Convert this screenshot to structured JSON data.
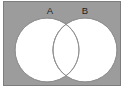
{
  "figure": {
    "kind": "venn-diagram",
    "canvas_width": 139,
    "canvas_height": 93,
    "canvas_background": "#ffffff"
  },
  "universe": {
    "name": "universal-set-rectangle",
    "fill": "#9c9c9c",
    "stroke": "#7d7d7d",
    "x": 3,
    "y": 1,
    "width": 118,
    "height": 85
  },
  "sets": [
    {
      "label": "A",
      "label_x": 50,
      "label_y": 13,
      "circle_cx": 47,
      "circle_cy": 50,
      "circle_r": 32,
      "fill": "#ffffff",
      "stroke": "#8e8e8e"
    },
    {
      "label": "B",
      "label_x": 85,
      "label_y": 13,
      "circle_cx": 85,
      "circle_cy": 50,
      "circle_r": 32,
      "fill": "#ffffff",
      "stroke": "#8e8e8e"
    }
  ],
  "intersection": {
    "name": "a-intersect-b-lens",
    "fill": "#ffffff",
    "stroke": "#8e8e8e",
    "shaded": false
  },
  "colors": {
    "universe_gray": "#9c9c9c",
    "set_white": "#ffffff",
    "outline_gray": "#8e8e8e",
    "label_black": "#1c1c1c",
    "page_white": "#ffffff"
  }
}
